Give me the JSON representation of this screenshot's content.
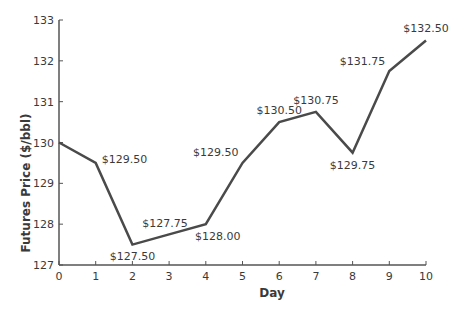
{
  "chart_data": {
    "type": "line",
    "title": "",
    "xlabel": "Day",
    "ylabel": "Futures Price ($/bbl)",
    "x": [
      0,
      1,
      2,
      3,
      4,
      5,
      6,
      7,
      8,
      9,
      10
    ],
    "values": [
      130.0,
      129.5,
      127.5,
      127.75,
      128.0,
      129.5,
      130.5,
      130.75,
      129.75,
      131.75,
      132.5
    ],
    "data_labels": [
      "",
      "$129.50",
      "$127.50",
      "$127.75",
      "$128.00",
      "$129.50",
      "$130.50",
      "$130.75",
      "$129.75",
      "$131.75",
      "$132.50"
    ],
    "xlim": [
      0,
      10
    ],
    "ylim": [
      127,
      133
    ],
    "xticks": [
      "0",
      "1",
      "2",
      "3",
      "4",
      "5",
      "6",
      "7",
      "8",
      "9",
      "10"
    ],
    "yticks": [
      "127",
      "128",
      "129",
      "130",
      "131",
      "132",
      "133"
    ],
    "grid": false,
    "legend": null,
    "line_color": "#4a4a4a"
  }
}
